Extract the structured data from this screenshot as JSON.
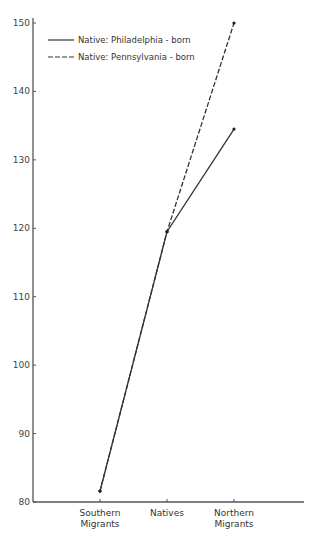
{
  "chart_data": {
    "type": "line",
    "title": "",
    "xlabel": "",
    "ylabel": "",
    "categories": [
      "Southern Migrants",
      "Natives",
      "Northern Migrants"
    ],
    "category_lines": [
      [
        "Southern",
        "Migrants"
      ],
      [
        "Natives"
      ],
      [
        "Northern",
        "Migrants"
      ]
    ],
    "ylim": [
      80,
      150
    ],
    "yticks": [
      80,
      90,
      100,
      110,
      120,
      130,
      140,
      150
    ],
    "grid": false,
    "legend_position": "upper-left",
    "series": [
      {
        "name": "Native: Philadelphia-born",
        "style": "solid",
        "values": [
          81.6,
          119.5,
          134.5
        ]
      },
      {
        "name": "Native: Pennsylvania-born",
        "style": "dashed",
        "values": [
          81.6,
          119.5,
          150
        ]
      }
    ]
  },
  "legend": {
    "items": [
      "Native: Philadelphia - born",
      "Native: Pennsylvania - born"
    ]
  }
}
